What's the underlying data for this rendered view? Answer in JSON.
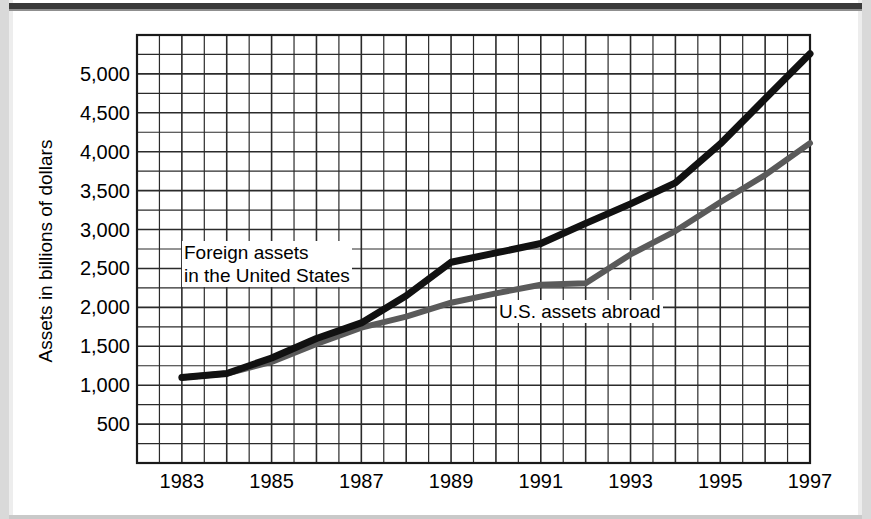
{
  "figure": {
    "background_color": "#ffffff",
    "top_rule_color": "#3a3a3a"
  },
  "chart_data": {
    "type": "line",
    "title": "",
    "xlabel": "",
    "ylabel": "Assets in billions of dollars",
    "xlim": [
      1982,
      1997
    ],
    "ylim": [
      0,
      5500
    ],
    "grid": true,
    "grid_y_step": 250,
    "grid_x_step": 0.5,
    "legend_position": "inline-annotation",
    "y_ticks": [
      500,
      1000,
      1500,
      2000,
      2500,
      3000,
      3500,
      4000,
      4500,
      5000
    ],
    "y_tick_labels": [
      "500",
      "1,000",
      "1,500",
      "2,000",
      "2,500",
      "3,000",
      "3,500",
      "4,000",
      "4,500",
      "5,000"
    ],
    "x_ticks": [
      1983,
      1985,
      1987,
      1989,
      1991,
      1993,
      1995,
      1997
    ],
    "x_tick_labels": [
      "1983",
      "1985",
      "1987",
      "1989",
      "1991",
      "1993",
      "1995",
      "1997"
    ],
    "x": [
      1983,
      1984,
      1985,
      1986,
      1987,
      1988,
      1989,
      1990,
      1991,
      1992,
      1993,
      1994,
      1995,
      1996,
      1997
    ],
    "series": [
      {
        "name": "Foreign assets in the United States",
        "color": "#111111",
        "width": 7,
        "values": [
          1100,
          1150,
          1350,
          1600,
          1800,
          2150,
          2580,
          2700,
          2820,
          3080,
          3330,
          3600,
          4100,
          4680,
          5260
        ]
      },
      {
        "name": "U.S. assets abroad",
        "color": "#5a5a5a",
        "width": 6,
        "values": [
          1100,
          1150,
          1300,
          1530,
          1740,
          1880,
          2060,
          2180,
          2290,
          2310,
          2680,
          2980,
          3350,
          3700,
          4110
        ]
      }
    ],
    "annotations": [
      {
        "text_line1": "Foreign assets",
        "text_line2": "in the United States",
        "series": "Foreign assets in the United States"
      },
      {
        "text_line1": "U.S. assets abroad",
        "text_line2": "",
        "series": "U.S. assets abroad"
      }
    ]
  }
}
